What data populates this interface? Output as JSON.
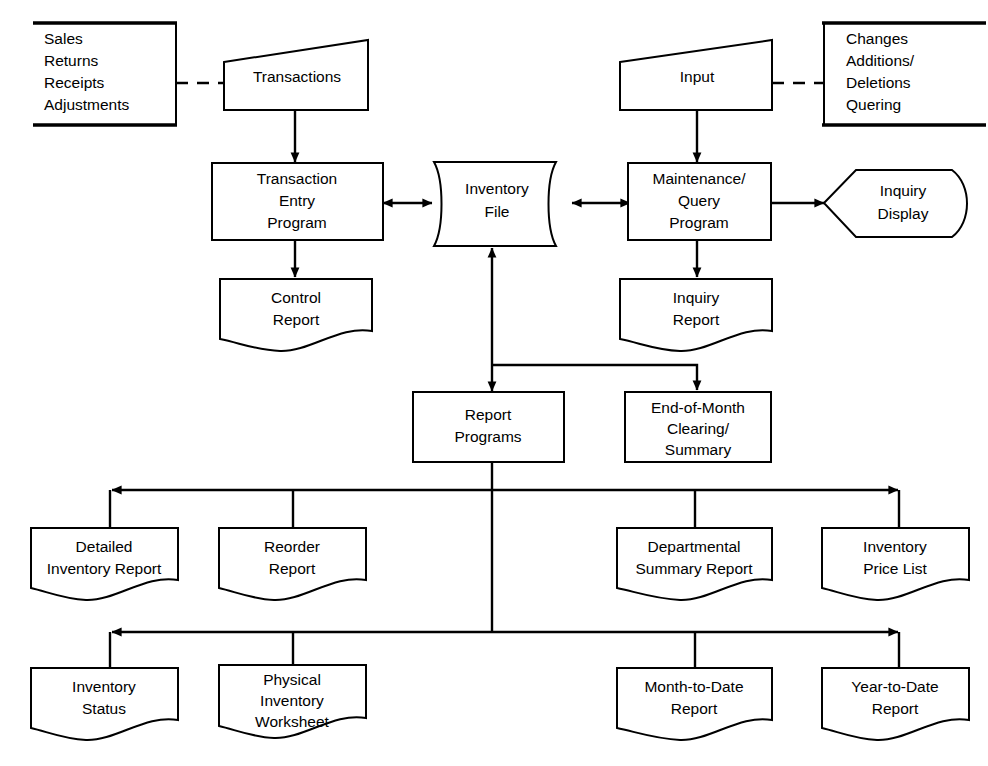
{
  "diagram": {
    "stroke_color": "#000000",
    "background_color": "#ffffff"
  },
  "annotations": [
    {
      "id": "transaction-sources",
      "lines": [
        "Sales",
        "Returns",
        "Receipts",
        "Adjustments"
      ]
    },
    {
      "id": "maintenance-sources",
      "lines": [
        "Changes",
        "Additions/",
        "Deletions",
        "Quering"
      ]
    }
  ],
  "nodes": {
    "transactions": {
      "label": "Transactions",
      "shape": "manual-input"
    },
    "input": {
      "label": "Input",
      "shape": "manual-input"
    },
    "transaction_entry_program": {
      "lines": [
        "Transaction",
        "Entry",
        "Program"
      ],
      "shape": "process"
    },
    "inventory_file": {
      "lines": [
        "Inventory",
        "File"
      ],
      "shape": "direct-access-storage"
    },
    "maintenance_query_program": {
      "lines": [
        "Maintenance/",
        "Query",
        "Program"
      ],
      "shape": "process"
    },
    "inquiry_display": {
      "lines": [
        "Inquiry",
        "Display"
      ],
      "shape": "display"
    },
    "control_report": {
      "lines": [
        "Control",
        "Report"
      ],
      "shape": "document"
    },
    "inquiry_report": {
      "lines": [
        "Inquiry",
        "Report"
      ],
      "shape": "document"
    },
    "report_programs": {
      "lines": [
        "Report",
        "Programs"
      ],
      "shape": "process"
    },
    "end_of_month": {
      "lines": [
        "End-of-Month",
        "Clearing/",
        "Summary"
      ],
      "shape": "process"
    },
    "detailed_inventory_report": {
      "lines": [
        "Detailed",
        "Inventory Report"
      ],
      "shape": "document"
    },
    "reorder_report": {
      "lines": [
        "Reorder",
        "Report"
      ],
      "shape": "document"
    },
    "departmental_summary_report": {
      "lines": [
        "Departmental",
        "Summary Report"
      ],
      "shape": "document"
    },
    "inventory_price_list": {
      "lines": [
        "Inventory",
        "Price List"
      ],
      "shape": "document"
    },
    "inventory_status": {
      "lines": [
        "Inventory",
        "Status"
      ],
      "shape": "document"
    },
    "physical_inventory_worksheet": {
      "lines": [
        "Physical",
        "Inventory",
        "Worksheet"
      ],
      "shape": "document"
    },
    "month_to_date_report": {
      "lines": [
        "Month-to-Date",
        "Report"
      ],
      "shape": "document"
    },
    "year_to_date_report": {
      "lines": [
        "Year-to-Date",
        "Report"
      ],
      "shape": "document"
    }
  },
  "edges": [
    {
      "from": "transaction-sources",
      "to": "transactions",
      "style": "dashed",
      "arrow": "none"
    },
    {
      "from": "transactions",
      "to": "transaction_entry_program",
      "style": "solid",
      "arrow": "end"
    },
    {
      "from": "transaction_entry_program",
      "to": "inventory_file",
      "style": "solid",
      "arrow": "both"
    },
    {
      "from": "transaction_entry_program",
      "to": "control_report",
      "style": "solid",
      "arrow": "end"
    },
    {
      "from": "maintenance-sources",
      "to": "input",
      "style": "dashed",
      "arrow": "none"
    },
    {
      "from": "input",
      "to": "maintenance_query_program",
      "style": "solid",
      "arrow": "end"
    },
    {
      "from": "inventory_file",
      "to": "maintenance_query_program",
      "style": "solid",
      "arrow": "both"
    },
    {
      "from": "maintenance_query_program",
      "to": "inquiry_display",
      "style": "solid",
      "arrow": "end"
    },
    {
      "from": "maintenance_query_program",
      "to": "inquiry_report",
      "style": "solid",
      "arrow": "end"
    },
    {
      "from": "inventory_file",
      "to": "report_programs",
      "style": "solid",
      "arrow": "both"
    },
    {
      "from": "inventory_file",
      "to": "end_of_month",
      "style": "solid",
      "arrow": "end"
    },
    {
      "from": "report_programs",
      "to": "detailed_inventory_report",
      "style": "solid",
      "arrow": "end"
    },
    {
      "from": "report_programs",
      "to": "reorder_report",
      "style": "solid",
      "arrow": "none"
    },
    {
      "from": "report_programs",
      "to": "departmental_summary_report",
      "style": "solid",
      "arrow": "none"
    },
    {
      "from": "report_programs",
      "to": "inventory_price_list",
      "style": "solid",
      "arrow": "end"
    },
    {
      "from": "report_programs",
      "to": "inventory_status",
      "style": "solid",
      "arrow": "end"
    },
    {
      "from": "report_programs",
      "to": "physical_inventory_worksheet",
      "style": "solid",
      "arrow": "none"
    },
    {
      "from": "report_programs",
      "to": "month_to_date_report",
      "style": "solid",
      "arrow": "none"
    },
    {
      "from": "report_programs",
      "to": "year_to_date_report",
      "style": "solid",
      "arrow": "end"
    }
  ]
}
